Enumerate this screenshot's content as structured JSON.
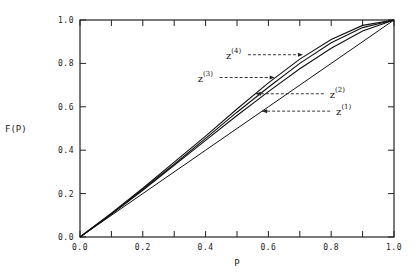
{
  "chart_data": {
    "type": "line",
    "title": "",
    "xlabel": "P",
    "ylabel": "F(P)",
    "xlim": [
      0.0,
      1.0
    ],
    "ylim": [
      0.0,
      1.0
    ],
    "grid": false,
    "xticks": [
      "0.0",
      "0.2",
      "0.4",
      "0.6",
      "0.8",
      "1.0"
    ],
    "yticks": [
      "0.0",
      "0.2",
      "0.4",
      "0.6",
      "0.8",
      "1.0"
    ],
    "series": [
      {
        "name": "z(1)",
        "label_main": "z",
        "label_sup": "(1)",
        "x": [
          0.0,
          0.2,
          0.4,
          0.6,
          0.8,
          1.0
        ],
        "y": [
          0.0,
          0.2,
          0.4,
          0.6,
          0.8,
          1.0
        ],
        "annotation": {
          "x": 0.58,
          "y": 0.58,
          "label_side": "right"
        }
      },
      {
        "name": "z(2)",
        "label_main": "z",
        "label_sup": "(2)",
        "x": [
          0.0,
          0.1,
          0.2,
          0.3,
          0.4,
          0.5,
          0.6,
          0.7,
          0.8,
          0.9,
          1.0
        ],
        "y": [
          0.0,
          0.105,
          0.215,
          0.33,
          0.445,
          0.56,
          0.67,
          0.775,
          0.87,
          0.95,
          1.0
        ],
        "annotation": {
          "x": 0.56,
          "y": 0.66,
          "label_side": "right"
        }
      },
      {
        "name": "z(3)",
        "label_main": "z",
        "label_sup": "(3)",
        "x": [
          0.0,
          0.1,
          0.2,
          0.3,
          0.4,
          0.5,
          0.6,
          0.7,
          0.8,
          0.9,
          1.0
        ],
        "y": [
          0.0,
          0.108,
          0.22,
          0.335,
          0.455,
          0.575,
          0.69,
          0.8,
          0.895,
          0.965,
          1.0
        ],
        "annotation": {
          "x": 0.62,
          "y": 0.735,
          "label_side": "left"
        }
      },
      {
        "name": "z(4)",
        "label_main": "z",
        "label_sup": "(4)",
        "x": [
          0.0,
          0.1,
          0.2,
          0.3,
          0.4,
          0.5,
          0.6,
          0.7,
          0.8,
          0.9,
          1.0
        ],
        "y": [
          0.0,
          0.11,
          0.225,
          0.345,
          0.465,
          0.59,
          0.71,
          0.82,
          0.91,
          0.975,
          1.0
        ],
        "annotation": {
          "x": 0.71,
          "y": 0.84,
          "label_side": "left"
        }
      }
    ]
  }
}
